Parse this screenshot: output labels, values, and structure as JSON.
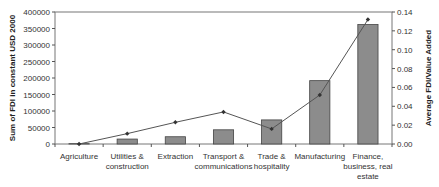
{
  "chart_data": {
    "type": "bar+line",
    "title": "",
    "categories": [
      "Agriculture",
      "Utilities & construction",
      "Extraction",
      "Transport & communications",
      "Trade & hospitality",
      "Manufacturing",
      "Finance, business, real estate"
    ],
    "category_lines": [
      [
        "Agriculture"
      ],
      [
        "Utilities &",
        "construction"
      ],
      [
        "Extraction"
      ],
      [
        "Transport &",
        "communications"
      ],
      [
        "Trade &",
        "hospitality"
      ],
      [
        "Manufacturing"
      ],
      [
        "Finance,",
        "business, real",
        "estate"
      ]
    ],
    "series": [
      {
        "name": "Sum of FDI in constant USD 2000",
        "type": "bar",
        "axis": "left",
        "values": [
          1000,
          15000,
          22000,
          43000,
          73000,
          192000,
          362000
        ],
        "color": "#8c8c8c"
      },
      {
        "name": "Average FDI/Value Added",
        "type": "line",
        "axis": "right",
        "values": [
          0.0,
          0.011,
          0.023,
          0.034,
          0.016,
          0.052,
          0.132
        ],
        "color": "#555555"
      }
    ],
    "ylabel": "Sum of FDI in constant USD 2000",
    "y2label": "Average FDI/Value Added",
    "ylim": [
      0,
      400000
    ],
    "y2lim": [
      0,
      0.14
    ],
    "yticks": [
      "0",
      "50000",
      "100000",
      "150000",
      "200000",
      "250000",
      "300000",
      "350000",
      "400000"
    ],
    "y2ticks": [
      "0.00",
      "0.02",
      "0.04",
      "0.06",
      "0.08",
      "0.10",
      "0.12",
      "0.14"
    ],
    "grid": false,
    "legend": "none"
  }
}
